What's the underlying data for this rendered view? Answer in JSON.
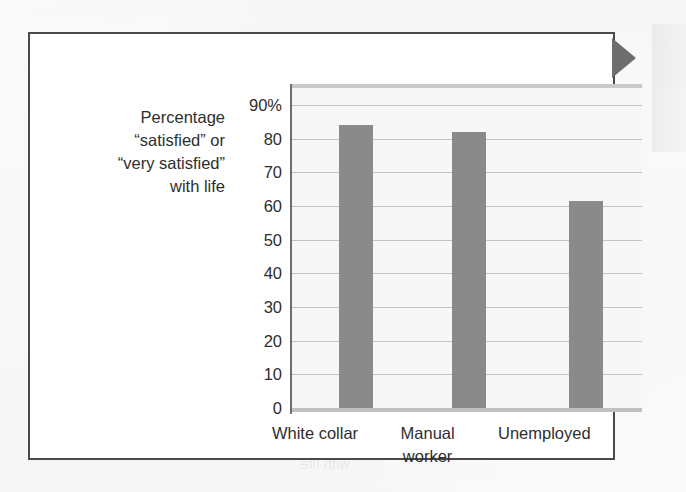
{
  "figure": {
    "bleed_through_artifact": "very satisfied",
    "bleed_through_artifact_2": "with life"
  },
  "chart_data": {
    "type": "bar",
    "title": "",
    "subtitle": "",
    "xlabel": "",
    "ylabel": "Percentage “satisfied” or “very satisfied” with life",
    "ylabel_lines": [
      "Percentage",
      "“satisfied” or",
      "“very satisfied”",
      "with life"
    ],
    "categories": [
      "White collar",
      "Manual worker",
      "Unemployed"
    ],
    "category_label_lines": [
      [
        "White collar"
      ],
      [
        "Manual",
        "worker"
      ],
      [
        "Unemployed"
      ]
    ],
    "values": [
      84,
      82,
      61.5
    ],
    "ylim": [
      0,
      90
    ],
    "yticks": [
      0,
      10,
      20,
      30,
      40,
      50,
      60,
      70,
      80,
      90
    ],
    "ytick_labels": [
      "0",
      "10",
      "20",
      "30",
      "40",
      "50",
      "60",
      "70",
      "80",
      "90%"
    ],
    "grid": true,
    "legend": false,
    "bar_color": "#8a8a8a",
    "plot_background": "#f7f7f7",
    "gridline_color": "#c4c4c4",
    "axis_color": "#6d6d6d",
    "frame_color": "#4a4a4a",
    "marker_color": "#6e6e6e"
  }
}
